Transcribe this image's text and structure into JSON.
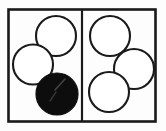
{
  "figure": {
    "title": "Two-panel box diagram with six circles, one filled black",
    "background_color": "#fdfdfd",
    "stroke_color": "#1a1a1a",
    "fill_white": "#ffffff",
    "fill_black": "#0d0d0d",
    "highlight_color": "#6e6e6e",
    "frame": {
      "name": "outer-rectangle",
      "x": 8.5,
      "y": 9.5,
      "width": 147,
      "height": 112,
      "stroke_width": 2.6
    },
    "divider": {
      "name": "vertical-divider",
      "x": 82,
      "y1": 9.5,
      "y2": 121.5,
      "stroke_width": 2.2
    },
    "panels": [
      {
        "id": "left",
        "label": "Left panel",
        "circle_count": 3,
        "filled_count": 1
      },
      {
        "id": "right",
        "label": "Right panel",
        "circle_count": 3,
        "filled_count": 0
      }
    ],
    "circles": [
      {
        "id": "left-top",
        "panel": "left",
        "label": "Left panel upper circle",
        "cx": 56,
        "cy": 36,
        "r": 20,
        "fill": "#ffffff",
        "stroke": "#1a1a1a",
        "stroke_width": 2.1,
        "state": "outline"
      },
      {
        "id": "left-middle",
        "panel": "left",
        "label": "Left panel middle-left circle",
        "cx": 33,
        "cy": 64.5,
        "r": 20,
        "fill": "#ffffff",
        "stroke": "#1a1a1a",
        "stroke_width": 2.1,
        "state": "outline"
      },
      {
        "id": "left-bottom-filled",
        "panel": "left",
        "label": "Left panel lower filled circle",
        "cx": 57,
        "cy": 94,
        "r": 21,
        "fill": "#0d0d0d",
        "stroke": "#0d0d0d",
        "stroke_width": 1.2,
        "state": "filled"
      },
      {
        "id": "right-top",
        "panel": "right",
        "label": "Right panel upper circle",
        "cx": 110,
        "cy": 36,
        "r": 20,
        "fill": "#ffffff",
        "stroke": "#1a1a1a",
        "stroke_width": 2.1,
        "state": "outline"
      },
      {
        "id": "right-middle",
        "panel": "right",
        "label": "Right panel middle-right circle",
        "cx": 134,
        "cy": 69,
        "r": 20,
        "fill": "#ffffff",
        "stroke": "#1a1a1a",
        "stroke_width": 2.1,
        "state": "outline"
      },
      {
        "id": "right-bottom",
        "panel": "right",
        "label": "Right panel lower circle",
        "cx": 109,
        "cy": 92,
        "r": 20,
        "fill": "#ffffff",
        "stroke": "#1a1a1a",
        "stroke_width": 2.1,
        "state": "outline"
      }
    ],
    "highlights": [
      {
        "id": "highlight-streak-upper",
        "label": "Diagonal highlight streak on filled circle",
        "x1": 65,
        "y1": 79,
        "x2": 55,
        "y2": 90,
        "stroke_width": 1.6,
        "opacity": 0.55
      },
      {
        "id": "highlight-streak-lower",
        "label": "Lower diagonal highlight streak on filled circle",
        "x1": 56,
        "y1": 92,
        "x2": 50,
        "y2": 101,
        "stroke_width": 1.4,
        "opacity": 0.42
      }
    ]
  }
}
